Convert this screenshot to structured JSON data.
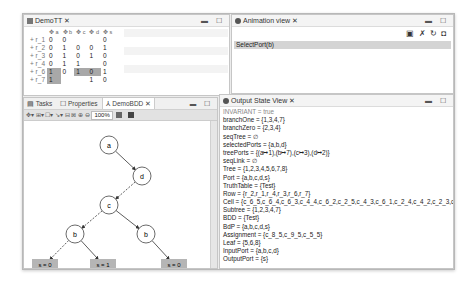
{
  "truth_table": {
    "title": "DemoTT",
    "columns": [
      "a",
      "b",
      "c",
      "d",
      "s"
    ],
    "rows": [
      {
        "label": "r_1",
        "cells": [
          "0",
          "0",
          "",
          "",
          "0"
        ],
        "highlight": []
      },
      {
        "label": "r_2",
        "cells": [
          "0",
          "1",
          "0",
          "0",
          "1"
        ],
        "highlight": []
      },
      {
        "label": "r_3",
        "cells": [
          "0",
          "1",
          "0",
          "1",
          "0"
        ],
        "highlight": []
      },
      {
        "label": "r_4",
        "cells": [
          "0",
          "1",
          "1",
          "",
          "0"
        ],
        "highlight": []
      },
      {
        "label": "r_6",
        "cells": [
          "1",
          "0",
          "1",
          "0",
          "1"
        ],
        "highlight": [
          0,
          2,
          3
        ]
      },
      {
        "label": "r_7",
        "cells": [
          "1",
          "",
          "",
          "1",
          "0"
        ],
        "highlight": [
          0
        ]
      }
    ]
  },
  "animation_view": {
    "title": "Animation view",
    "toolbar_icons": [
      "monitor-play-icon",
      "run-icon",
      "refresh-icon",
      "save-icon"
    ],
    "events": [
      "SelectPort(b)"
    ]
  },
  "bottom_left": {
    "tabs": [
      {
        "label": "Tasks",
        "icon": "tasks-icon"
      },
      {
        "label": "Properties",
        "icon": "properties-icon"
      },
      {
        "label": "DemoBDD",
        "icon": "bdd-icon",
        "active": true
      }
    ],
    "zoom_level": "100%",
    "bdd": {
      "nodes": [
        {
          "id": "n1",
          "label": "a",
          "x": 85,
          "y": 24
        },
        {
          "id": "n2",
          "label": "d",
          "x": 118,
          "y": 55
        },
        {
          "id": "n3",
          "label": "c",
          "x": 85,
          "y": 84
        },
        {
          "id": "n4",
          "label": "b",
          "x": 51,
          "y": 113
        },
        {
          "id": "n5",
          "label": "b",
          "x": 122,
          "y": 113
        }
      ],
      "leaves": [
        {
          "label": "s = 0",
          "x": 8,
          "y": 138
        },
        {
          "label": "s = 1",
          "x": 66,
          "y": 138
        },
        {
          "label": "s = 0",
          "x": 137,
          "y": 138
        }
      ]
    }
  },
  "output_state": {
    "title": "Output State View",
    "lines": [
      "INVARIANT = true",
      "branchOne = {1,3,4,7}",
      "branchZero = {2,3,4}",
      "seqTree = ∅",
      "selectedPorts = {a,b,d}",
      "treePorts = {(a↦1),(b↦7),(c↦3),(d↦2)}",
      "seqLink = ∅",
      "Tree = {1,2,3,4,5,6,7,8}",
      "Port = {a,b,c,d,s}",
      "TruthTable = {Test}",
      "Row = {r_2,r_1,r_4,r_3,r_6,r_7}",
      "Cell = {c_6_5,c_6_4,c_6_3,c_4_4,c_6_2,c_2_5,c_4_3,c_6_1,c_2_4,c_4_2,c_2_3,c_4",
      "Subtree = {1,2,3,4,7}",
      "BDD = {Test}",
      "BdP = {a,b,c,d,s}",
      "Assignment = {c_8_5,c_9_5,c_5_5}",
      "Leaf = {5,6,8}",
      "InputPort = {a,b,c,d}",
      "OutputPort = {s}"
    ]
  },
  "panel_controls": "▬ ☐"
}
